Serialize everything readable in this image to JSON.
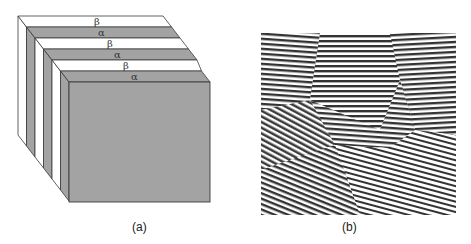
{
  "figure": {
    "panels": [
      {
        "id": "a",
        "caption": "(a)",
        "description": "Schematic 3D block of alternating lamellae",
        "layer_labels": [
          "β",
          "α",
          "β",
          "α",
          "β",
          "α"
        ],
        "colors": {
          "alpha_phase": "#a3a3a3",
          "beta_phase": "#ffffff",
          "edge": "#3a3a3a"
        }
      },
      {
        "id": "b",
        "caption": "(b)",
        "description": "Micrograph of lamellar stripe pattern with grain domains",
        "colors": {
          "dark_stripe": "#333333",
          "light_stripe": "#ffffff"
        }
      }
    ]
  }
}
